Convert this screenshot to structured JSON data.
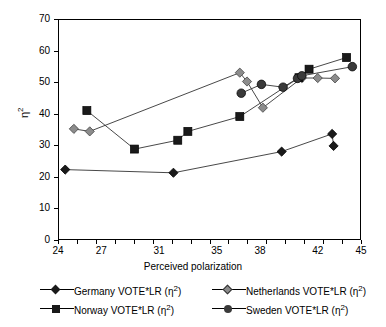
{
  "chart_data": {
    "type": "line",
    "title": "",
    "xlabel": "Perceived polarization",
    "ylabel": "η²",
    "xlim": [
      24,
      45
    ],
    "ylim": [
      0,
      70
    ],
    "xticks": [
      24,
      27,
      31,
      35,
      38,
      42,
      45
    ],
    "yticks": [
      0,
      10,
      20,
      30,
      40,
      50,
      60,
      70
    ],
    "grid": false,
    "legend_position": "bottom",
    "series": [
      {
        "name": "Germany VOTE*LR (η²)",
        "marker": "diamond-filled",
        "color": "#1a1a1a",
        "points": [
          {
            "x": 24.5,
            "y": 22.3
          },
          {
            "x": 32.0,
            "y": 21.3
          },
          {
            "x": 39.5,
            "y": 28.0
          },
          {
            "x": 43.0,
            "y": 33.6
          },
          {
            "x": 43.1,
            "y": 29.8
          }
        ]
      },
      {
        "name": "Netherlands VOTE*LR (η²)",
        "marker": "diamond-open",
        "color": "#8c8c8c",
        "points": [
          {
            "x": 25.1,
            "y": 35.2
          },
          {
            "x": 26.2,
            "y": 34.4
          },
          {
            "x": 36.6,
            "y": 53.0
          },
          {
            "x": 37.1,
            "y": 50.2
          },
          {
            "x": 38.2,
            "y": 41.9
          },
          {
            "x": 40.9,
            "y": 51.3
          },
          {
            "x": 42.0,
            "y": 51.3
          },
          {
            "x": 43.2,
            "y": 51.2
          }
        ]
      },
      {
        "name": "Norway VOTE*LR (η²)",
        "marker": "square-filled",
        "color": "#1a1a1a",
        "points": [
          {
            "x": 26.0,
            "y": 41.0
          },
          {
            "x": 29.3,
            "y": 28.8
          },
          {
            "x": 32.3,
            "y": 31.6
          },
          {
            "x": 33.0,
            "y": 34.4
          },
          {
            "x": 36.6,
            "y": 39.1
          },
          {
            "x": 40.7,
            "y": 51.4
          },
          {
            "x": 41.4,
            "y": 54.1
          },
          {
            "x": 44.0,
            "y": 57.8
          }
        ]
      },
      {
        "name": "Sweden VOTE*LR (η²)",
        "marker": "circle-filled",
        "color": "#3a3a3a",
        "points": [
          {
            "x": 36.7,
            "y": 46.5
          },
          {
            "x": 38.1,
            "y": 49.3
          },
          {
            "x": 39.6,
            "y": 48.4
          },
          {
            "x": 40.6,
            "y": 51.2
          },
          {
            "x": 40.9,
            "y": 52.0
          },
          {
            "x": 44.4,
            "y": 54.9
          }
        ]
      }
    ]
  },
  "axes": {
    "y_tick_labels": [
      "70",
      "60",
      "50",
      "40",
      "30",
      "20",
      "10",
      "0"
    ],
    "x_tick_labels": [
      "24",
      "27",
      "31",
      "35",
      "38",
      "42",
      "45"
    ],
    "x_axis_title": "Perceived polarization",
    "y_axis_title_base": "η",
    "y_axis_title_sup": "2"
  },
  "legend": {
    "rows": [
      [
        {
          "label_base": "Germany VOTE*LR (η",
          "label_sup": "2",
          "label_tail": ")",
          "marker": "diamond-filled"
        },
        {
          "label_base": "Netherlands VOTE*LR (η",
          "label_sup": "2",
          "label_tail": ")",
          "marker": "diamond-open"
        }
      ],
      [
        {
          "label_base": "Norway VOTE*LR (η",
          "label_sup": "2",
          "label_tail": ")",
          "marker": "square-filled"
        },
        {
          "label_base": "Sweden VOTE*LR (η",
          "label_sup": "2",
          "label_tail": ")",
          "marker": "circle-filled"
        }
      ]
    ]
  }
}
